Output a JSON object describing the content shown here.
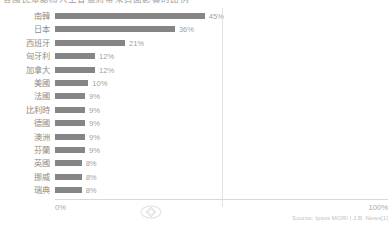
{
  "title": "各國民眾認為人工智慧將帶來負面影響的比例",
  "axis": {
    "zero_label": "0%",
    "hundred_label": "100%"
  },
  "watermark": "diamond-watermark-icon",
  "source_note": "Source: Ipsos MORI | J.B. News[1]",
  "colors": {
    "bar": "#858585",
    "label": "#8d8d8d",
    "value": "#a2a2a2",
    "grid": "#e2e2e2",
    "axis": "#d9d9d9"
  },
  "chart_data": {
    "type": "bar",
    "orientation": "horizontal",
    "title": "各國民眾認為人工智慧將帶來負面影響的比例",
    "xlabel": "",
    "ylabel": "",
    "xlim": [
      0,
      100
    ],
    "grid": true,
    "gridlines": [
      50
    ],
    "legend": "none",
    "categories": [
      "南韓",
      "日本",
      "西班牙",
      "匈牙利",
      "加拿大",
      "美國",
      "法國",
      "比利時",
      "德國",
      "澳洲",
      "芬蘭",
      "英國",
      "挪威",
      "瑞典"
    ],
    "values": [
      45,
      36,
      21,
      12,
      12,
      10,
      9,
      9,
      9,
      9,
      9,
      8,
      8,
      8
    ],
    "value_labels": [
      "45%",
      "36%",
      "21%",
      "12%",
      "12%",
      "10%",
      "9%",
      "9%",
      "9%",
      "9%",
      "9%",
      "8%",
      "8%",
      "8%"
    ]
  }
}
